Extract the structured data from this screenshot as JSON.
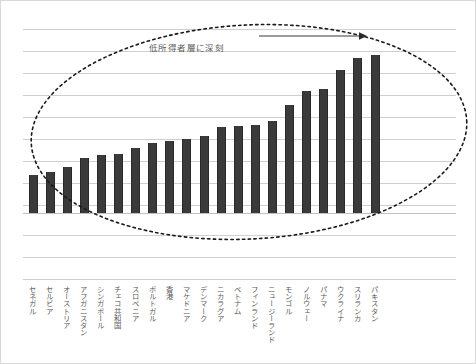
{
  "chart_data": {
    "type": "bar",
    "title": "",
    "subtitle": "",
    "xlabel": "",
    "ylabel": "",
    "grid": true,
    "legend": false,
    "ylim": [
      0,
      180
    ],
    "categories": [
      "セネガル",
      "セルビア",
      "オーストリア",
      "アフガニスタン",
      "シンガポール",
      "チェコ共和国",
      "スロベニア",
      "ポルトガル",
      "香港",
      "マケドニア",
      "デンマーク",
      "ニカラグア",
      "ベトナム",
      "フィンランド",
      "ニュージーランド",
      "モンゴル",
      "ノルウェー",
      "パナマ",
      "ウクライナ",
      "スリランカ",
      "パキスタン"
    ],
    "values": [
      38,
      41,
      46,
      55,
      58,
      59,
      65,
      70,
      72,
      74,
      77,
      86,
      87,
      88,
      92,
      108,
      122,
      124,
      143,
      155,
      158
    ],
    "bar_color": "#3a3a3a",
    "gridline_color": "#cfcfcf",
    "annotations": [
      {
        "name": "low-income-severity-note",
        "text": "低所得者層に深刻"
      }
    ],
    "shapes": [
      {
        "name": "dotted-ellipse",
        "style": "dotted",
        "color": "#1a1a1a"
      },
      {
        "name": "rightward-arrow",
        "style": "solid",
        "color": "#3a3a3a",
        "direction": "right"
      }
    ]
  },
  "labels": {
    "items": [
      "セネガル",
      "セルビア",
      "オーストリア",
      "アフガニスタン",
      "シンガポール",
      "チェコ共和国",
      "スロベニア",
      "ポルトガル",
      "香港",
      "マケドニア",
      "デンマーク",
      "ニカラグア",
      "ベトナム",
      "フィンランド",
      "ニュージーランド",
      "モンゴル",
      "ノルウェー",
      "パナマ",
      "ウクライナ",
      "スリランカ",
      "パキスタン"
    ]
  }
}
